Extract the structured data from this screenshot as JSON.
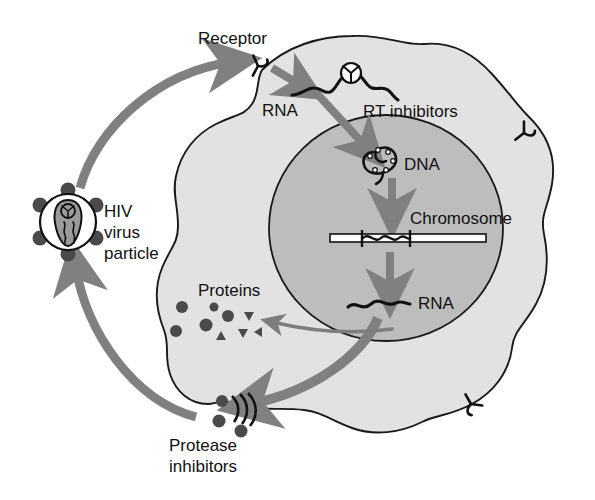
{
  "figure": {
    "type": "diagram"
  },
  "colors": {
    "background": "#ffffff",
    "cytoplasm": "#e2e2e2",
    "nucleus": "#bdbdbd",
    "outline": "#1a1a1a",
    "arrow": "#808080",
    "arrow_small": "#7d7d7d",
    "text": "#111111",
    "virus_core": "#9a9a9a",
    "virus_knob": "#4a4a4a",
    "protein_particle": "#4a4a4a",
    "chromosome_bar": "#ffffff"
  },
  "labels": {
    "receptor": "Receptor",
    "rna_cytoplasm": "RNA",
    "rt_inhibitors": "RT inhibitors",
    "dna": "DNA",
    "chromosome": "Chromosome",
    "rna_nucleus": "RNA",
    "proteins": "Proteins",
    "hiv_line1": "HIV",
    "hiv_line2": "virus",
    "hiv_line3": "particle",
    "protease_line1": "Protease",
    "protease_line2": "inhibitors"
  },
  "structures": {
    "cell": {
      "name": "host cell",
      "fill": "#e2e2e2"
    },
    "nucleus": {
      "name": "nucleus",
      "fill": "#bdbdbd",
      "cx": 386,
      "cy": 228,
      "rx": 116,
      "ry": 112
    },
    "virus_particle": {
      "name": "HIV virus particle",
      "cx": 68,
      "cy": 222,
      "r": 28,
      "knob_count": 6,
      "capsid": "cone-shaped core with wavy RNA"
    },
    "receptors": [
      {
        "name": "receptor-entry",
        "x": 257,
        "y": 65
      },
      {
        "name": "receptor-right",
        "x": 523,
        "y": 132
      },
      {
        "name": "receptor-bottom-right",
        "x": 470,
        "y": 405
      }
    ],
    "budding_site": {
      "name": "budding virion",
      "x": 215,
      "y": 406
    },
    "chromosome": {
      "name": "chromosome",
      "x1": 330,
      "x2": 486,
      "y": 238,
      "integrated_segment": "wavy provirus between two tick marks"
    },
    "protein_particles": {
      "circles": 3,
      "triangles": 4
    }
  },
  "arrows": [
    {
      "name": "virus-to-receptor",
      "from": "HIV virus particle",
      "to": "Receptor",
      "style": "large-curved"
    },
    {
      "name": "receptor-to-rna",
      "from": "Receptor",
      "to": "RNA",
      "style": "small-straight"
    },
    {
      "name": "rna-to-dna",
      "from": "RNA",
      "to": "DNA",
      "style": "small-straight"
    },
    {
      "name": "dna-to-chromosome",
      "from": "DNA",
      "to": "Chromosome",
      "style": "small-straight"
    },
    {
      "name": "chromosome-to-rna",
      "from": "Chromosome",
      "to": "RNA",
      "style": "small-straight"
    },
    {
      "name": "rna-to-proteins",
      "from": "RNA",
      "to": "Proteins",
      "style": "thin-curved"
    },
    {
      "name": "rna-to-budding",
      "from": "RNA",
      "to": "budding virion",
      "style": "large-curved"
    },
    {
      "name": "budding-to-virus",
      "from": "budding virion",
      "to": "HIV virus particle",
      "style": "large-curved"
    }
  ]
}
